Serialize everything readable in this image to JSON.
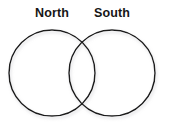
{
  "figure": {
    "type": "venn-diagram",
    "title": "",
    "background_color": "#ffffff",
    "stroke_color": "#1a1a1a",
    "shadow_color": "#b9b9b9",
    "label_color": "#161616",
    "sets": [
      {
        "id": "north",
        "label": "North",
        "center_x": 52,
        "center_y": 73,
        "radius": 43,
        "label_x": 52,
        "label_y": 14
      },
      {
        "id": "south",
        "label": "South",
        "center_x": 112,
        "center_y": 73,
        "radius": 43,
        "label_x": 112,
        "label_y": 14
      }
    ],
    "regions": {
      "left_only": "",
      "intersection": "",
      "right_only": ""
    }
  }
}
